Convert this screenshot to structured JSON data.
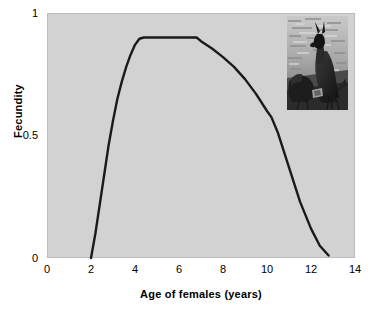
{
  "figure": {
    "background": "#ffffff",
    "plot_background": "#d2d2d2",
    "curve_color": "#1a1a1a"
  },
  "axes": {
    "y_label": "Fecundity",
    "x_label": "Age of females (years)",
    "y_ticks": [
      "0",
      "0.5",
      "1"
    ],
    "x_ticks": [
      "0",
      "2",
      "4",
      "6",
      "8",
      "10",
      "12",
      "14"
    ]
  },
  "inset": {
    "caption": "kangaroo-photograph",
    "alt": "Black and white photograph of an adult female kangaroo with a joey"
  },
  "chart_data": {
    "type": "line",
    "title": "",
    "subtitle": "",
    "xlabel": "Age of females (years)",
    "ylabel": "Fecundity",
    "xlim": [
      0,
      14
    ],
    "ylim": [
      0,
      1
    ],
    "xticks": [
      0,
      2,
      4,
      6,
      8,
      10,
      12,
      14
    ],
    "yticks": [
      0,
      0.5,
      1
    ],
    "grid": false,
    "legend": null,
    "legend_position": "none",
    "annotations": [
      "Inset photograph of kangaroo and joey placed in upper-right of plot area"
    ],
    "series": [
      {
        "name": "Fecundity of females by age",
        "x": [
          2.0,
          2.2,
          2.4,
          2.6,
          2.8,
          3.0,
          3.2,
          3.4,
          3.6,
          3.8,
          4.0,
          4.2,
          4.4,
          4.6,
          5.0,
          5.5,
          6.0,
          6.5,
          6.8,
          7.0,
          7.5,
          8.0,
          8.5,
          9.0,
          9.5,
          10.0,
          10.2,
          10.5,
          11.0,
          11.5,
          12.0,
          12.4,
          12.8
        ],
        "y": [
          0.0,
          0.1,
          0.22,
          0.34,
          0.46,
          0.56,
          0.65,
          0.72,
          0.78,
          0.83,
          0.87,
          0.895,
          0.9,
          0.9,
          0.9,
          0.9,
          0.9,
          0.9,
          0.9,
          0.885,
          0.855,
          0.82,
          0.78,
          0.73,
          0.67,
          0.6,
          0.575,
          0.51,
          0.37,
          0.23,
          0.12,
          0.05,
          0.01
        ]
      }
    ]
  }
}
